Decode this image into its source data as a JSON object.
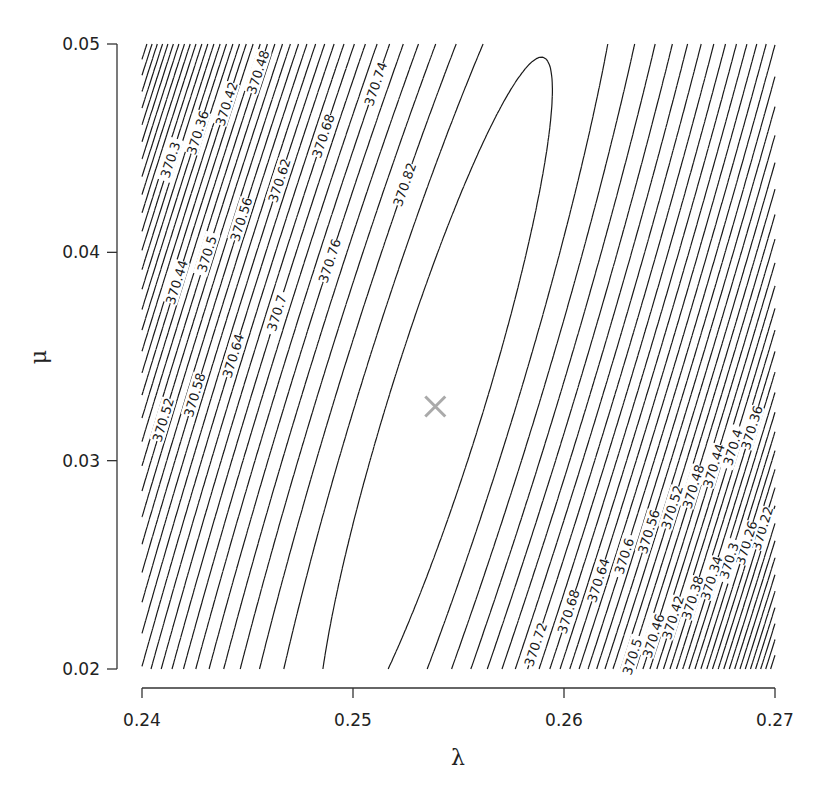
{
  "chart_data": {
    "type": "contour",
    "title": "",
    "xlabel": "λ",
    "ylabel": "μ",
    "xlim": [
      0.24,
      0.27
    ],
    "ylim": [
      0.02,
      0.05
    ],
    "x_ticks": [
      0.24,
      0.25,
      0.26,
      0.27
    ],
    "x_tick_labels": [
      "0.24",
      "0.25",
      "0.26",
      "0.27"
    ],
    "y_ticks": [
      0.02,
      0.03,
      0.04,
      0.05
    ],
    "y_tick_labels": [
      "0.02",
      "0.03",
      "0.04",
      "0.05"
    ],
    "grid": false,
    "contour_levels": {
      "start": 370.0,
      "end": 370.86,
      "step": 0.02
    },
    "labeled_levels_upper_left": [
      "370",
      "370.12",
      "370.24",
      "370.34",
      "370.44",
      "370.52",
      "370.6",
      "370.66",
      "370.72",
      "370.78",
      "370.82",
      "370.84",
      "370.2",
      "370.3",
      "370.4",
      "370.48",
      "370.56",
      "370.64",
      "370.7",
      "370.76",
      "370.8",
      "370.86",
      "370.32",
      "370.42",
      "370.5",
      "370.58",
      "370.68",
      "370.74",
      "370.54",
      "370.62"
    ],
    "labeled_levels_lower_right": [
      "370.82",
      "370.8",
      "370.78",
      "370.76",
      "370.74",
      "370.72",
      "370.7",
      "370.68",
      "370.66",
      "370.64",
      "370.62",
      "370.6",
      "370.58",
      "370.56",
      "370.54",
      "370.52",
      "370.5",
      "370.48",
      "370.46",
      "370.42",
      "370.38",
      "370.36",
      "370.34",
      "370.26",
      "370.24",
      "370.14"
    ],
    "maximum": {
      "x": 0.2539,
      "y": 0.0326,
      "value": 370.87,
      "marker": "cross",
      "color": "#aaaaaa"
    },
    "surface_model": {
      "form": "quadratic",
      "peak": 370.872,
      "center": [
        0.2539,
        0.0326
      ],
      "a_xx": 4200.0,
      "a_yy": 460.0,
      "a_xy": -2520.0
    }
  },
  "colors": {
    "contour": "#1a1a1a",
    "axis": "#333333",
    "marker": "#aaaaaa",
    "background": "#ffffff"
  }
}
